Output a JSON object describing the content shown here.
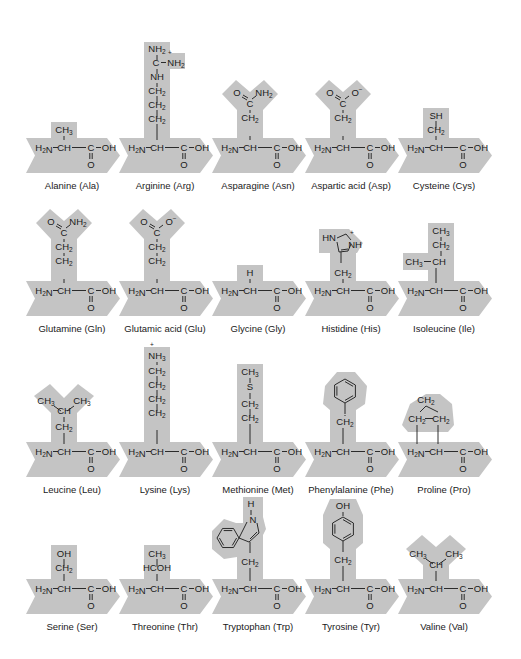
{
  "figure": {
    "backbone": {
      "amine": "H2N",
      "alpha_carbon": "CH",
      "carboxyl_carbon": "C",
      "hydroxyl": "OH",
      "carbonyl_oxygen": "O"
    },
    "colors": {
      "shade": "#c4c4c4",
      "ink": "#1a1a1a",
      "background": "#ffffff"
    },
    "rows": [
      {
        "chevron_top": 138,
        "amino_acids": [
          {
            "name": "Alanine",
            "abbr": "Ala",
            "label": "Alanine (Ala)",
            "side_chain": [
              "CH3"
            ]
          },
          {
            "name": "Arginine",
            "abbr": "Arg",
            "label": "Arginine (Arg)",
            "side_chain": [
              "NH2",
              "C=NH2+",
              "NH",
              "CH2",
              "CH2",
              "CH2"
            ]
          },
          {
            "name": "Asparagine",
            "abbr": "Asn",
            "label": "Asparagine (Asn)",
            "side_chain": [
              "O",
              "NH2",
              "C",
              "CH2"
            ]
          },
          {
            "name": "Aspartic acid",
            "abbr": "Asp",
            "label": "Aspartic acid (Asp)",
            "side_chain": [
              "O",
              "O-",
              "C",
              "CH2"
            ]
          },
          {
            "name": "Cysteine",
            "abbr": "Cys",
            "label": "Cysteine (Cys)",
            "side_chain": [
              "SH",
              "CH2"
            ]
          }
        ]
      },
      {
        "chevron_top": 281,
        "amino_acids": [
          {
            "name": "Glutamine",
            "abbr": "Gln",
            "label": "Glutamine (Gln)",
            "side_chain": [
              "O",
              "NH2",
              "C",
              "CH2",
              "CH2"
            ]
          },
          {
            "name": "Glutamic acid",
            "abbr": "Glu",
            "label": "Glutamic acid (Glu)",
            "side_chain": [
              "O",
              "O-",
              "C",
              "CH2",
              "CH2"
            ]
          },
          {
            "name": "Glycine",
            "abbr": "Gly",
            "label": "Glycine (Gly)",
            "side_chain": [
              "H"
            ]
          },
          {
            "name": "Histidine",
            "abbr": "His",
            "label": "Histidine (His)",
            "side_chain": [
              "HN",
              "NH+",
              "imidazole",
              "CH2"
            ]
          },
          {
            "name": "Isoleucine",
            "abbr": "Ile",
            "label": "Isoleucine (Ile)",
            "side_chain": [
              "CH3",
              "CH2",
              "CH3—CH"
            ]
          }
        ]
      },
      {
        "chevron_top": 442,
        "amino_acids": [
          {
            "name": "Leucine",
            "abbr": "Leu",
            "label": "Leucine (Leu)",
            "side_chain": [
              "CH3",
              "CH3",
              "CH",
              "CH2"
            ]
          },
          {
            "name": "Lysine",
            "abbr": "Lys",
            "label": "Lysine (Lys)",
            "side_chain": [
              "NH3+",
              "CH2",
              "CH2",
              "CH2",
              "CH2"
            ]
          },
          {
            "name": "Methionine",
            "abbr": "Met",
            "label": "Methionine (Met)",
            "side_chain": [
              "CH3",
              "S",
              "CH2",
              "CH2"
            ]
          },
          {
            "name": "Phenylalanine",
            "abbr": "Phe",
            "label": "Phenylalanine (Phe)",
            "side_chain": [
              "benzene",
              "CH2"
            ]
          },
          {
            "name": "Proline",
            "abbr": "Pro",
            "label": "Proline (Pro)",
            "side_chain": [
              "CH2",
              "CH2",
              "CH2"
            ]
          }
        ]
      },
      {
        "chevron_top": 579,
        "amino_acids": [
          {
            "name": "Serine",
            "abbr": "Ser",
            "label": "Serine (Ser)",
            "side_chain": [
              "OH",
              "CH2"
            ]
          },
          {
            "name": "Threonine",
            "abbr": "Thr",
            "label": "Threonine (Thr)",
            "side_chain": [
              "CH3",
              "HCOH"
            ]
          },
          {
            "name": "Tryptophan",
            "abbr": "Trp",
            "label": "Tryptophan (Trp)",
            "side_chain": [
              "H",
              "N",
              "indole",
              "CH2"
            ]
          },
          {
            "name": "Tyrosine",
            "abbr": "Tyr",
            "label": "Tyrosine (Tyr)",
            "side_chain": [
              "OH",
              "phenol",
              "CH2"
            ]
          },
          {
            "name": "Valine",
            "abbr": "Val",
            "label": "Valine (Val)",
            "side_chain": [
              "CH3",
              "CH3",
              "CH"
            ]
          }
        ]
      }
    ]
  }
}
